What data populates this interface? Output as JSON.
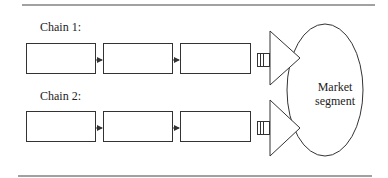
{
  "diagram": {
    "chains": [
      {
        "label": "Chain 1:",
        "boxes": [
          "",
          "",
          ""
        ]
      },
      {
        "label": "Chain 2:",
        "boxes": [
          "",
          "",
          ""
        ]
      }
    ],
    "target": {
      "line1": "Market",
      "line2": "segment"
    },
    "colors": {
      "stroke": "#333333",
      "background": "#ffffff"
    }
  }
}
